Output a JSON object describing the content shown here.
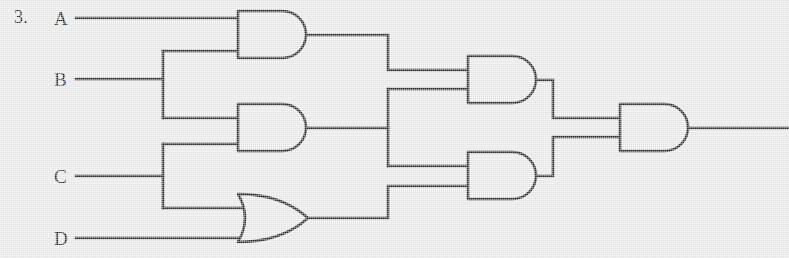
{
  "page": {
    "problem_number": "3.",
    "background_color": "#e9e9e9",
    "ink_color": "#2a2a2a",
    "width": 789,
    "height": 258
  },
  "diagram": {
    "type": "logic-circuit",
    "title": "",
    "inputs": [
      {
        "name": "A",
        "label": "A",
        "y": 18
      },
      {
        "name": "B",
        "label": "B",
        "y": 79
      },
      {
        "name": "C",
        "label": "C",
        "y": 176
      },
      {
        "name": "D",
        "label": "D",
        "y": 238
      }
    ],
    "outputs": [
      {
        "name": "out",
        "label": "",
        "y": 128
      }
    ],
    "gates": [
      {
        "id": "g1",
        "type": "AND",
        "label": "AND",
        "inputs": [
          "A",
          "B"
        ],
        "output": "g1_out",
        "x": 238,
        "y": 11,
        "w": 68,
        "h": 47
      },
      {
        "id": "g2",
        "type": "AND",
        "label": "AND",
        "inputs": [
          "B",
          "C"
        ],
        "output": "g2_out",
        "x": 238,
        "y": 104,
        "w": 68,
        "h": 47
      },
      {
        "id": "g3",
        "type": "OR",
        "label": "OR",
        "inputs": [
          "C",
          "D"
        ],
        "output": "g3_out",
        "x": 238,
        "y": 194,
        "w": 70,
        "h": 48
      },
      {
        "id": "g4",
        "type": "AND",
        "label": "AND",
        "inputs": [
          "g1_out",
          "g2_out"
        ],
        "output": "g4_out",
        "x": 468,
        "y": 56,
        "w": 68,
        "h": 47
      },
      {
        "id": "g5",
        "type": "AND",
        "label": "AND",
        "inputs": [
          "g2_out",
          "g3_out"
        ],
        "output": "g5_out",
        "x": 468,
        "y": 152,
        "w": 68,
        "h": 47
      },
      {
        "id": "g6",
        "type": "AND",
        "label": "AND",
        "inputs": [
          "g4_out",
          "g5_out"
        ],
        "output": "out",
        "x": 620,
        "y": 104,
        "w": 68,
        "h": 47
      }
    ],
    "wires": [
      {
        "name": "wire-A-to-g1",
        "path": "M 76 18 L 238 18"
      },
      {
        "name": "wire-B-trunk",
        "path": "M 76 79 L 163 79"
      },
      {
        "name": "wire-B-branch",
        "path": "M 163 51 L 163 118"
      },
      {
        "name": "wire-B-to-g1",
        "path": "M 163 51 L 238 51"
      },
      {
        "name": "wire-B-to-g2",
        "path": "M 163 118 L 238 118"
      },
      {
        "name": "wire-C-trunk",
        "path": "M 76 176 L 163 176"
      },
      {
        "name": "wire-C-branch",
        "path": "M 163 144 L 163 208"
      },
      {
        "name": "wire-C-to-g2",
        "path": "M 163 144 L 238 144"
      },
      {
        "name": "wire-C-to-g3",
        "path": "M 163 208 L 246 208"
      },
      {
        "name": "wire-D-to-g3",
        "path": "M 76 238 L 246 238"
      },
      {
        "name": "wire-g1-out",
        "path": "M 306 35 L 388 35 L 388 70 L 468 70"
      },
      {
        "name": "wire-g2-out",
        "path": "M 306 128 L 388 128"
      },
      {
        "name": "wire-g2-branch",
        "path": "M 388 89 L 388 166"
      },
      {
        "name": "wire-g2-to-g4",
        "path": "M 388 89 L 468 89"
      },
      {
        "name": "wire-g2-to-g5",
        "path": "M 388 166 L 468 166"
      },
      {
        "name": "wire-g3-out",
        "path": "M 308 218 L 388 218 L 388 186 L 468 186"
      },
      {
        "name": "wire-g4-out",
        "path": "M 536 80 L 553 80 L 553 118 L 620 118"
      },
      {
        "name": "wire-g5-out",
        "path": "M 536 176 L 553 176 L 553 137 L 620 137"
      },
      {
        "name": "wire-output",
        "path": "M 688 128 L 789 128"
      }
    ]
  }
}
